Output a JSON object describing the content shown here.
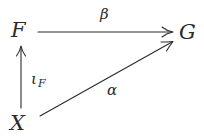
{
  "diagram": {
    "type": "commutative-diagram",
    "nodes": [
      {
        "id": "F",
        "label": "F"
      },
      {
        "id": "G",
        "label": "G"
      },
      {
        "id": "X",
        "label": "X"
      }
    ],
    "edges": [
      {
        "from": "F",
        "to": "G",
        "label": "β"
      },
      {
        "from": "X",
        "to": "F",
        "label": "ι",
        "label_sub": "F"
      },
      {
        "from": "X",
        "to": "G",
        "label": "α"
      }
    ],
    "colors": {
      "ink": "#2a2a2a",
      "background": "#ffffff"
    }
  }
}
